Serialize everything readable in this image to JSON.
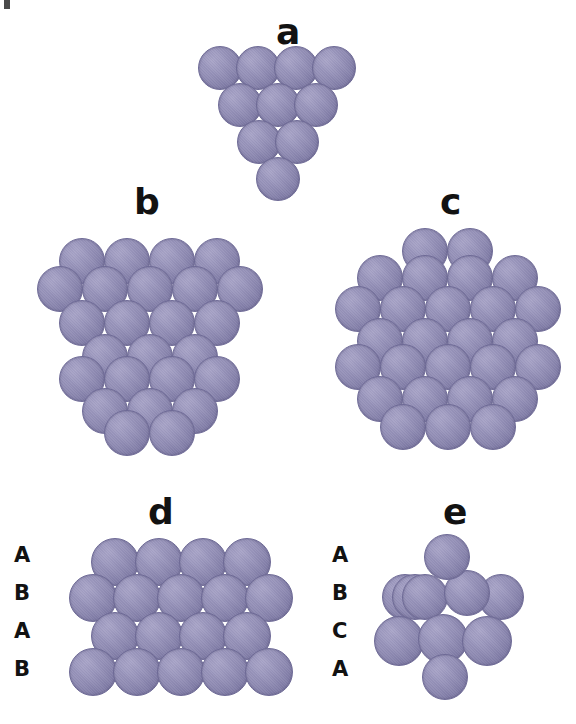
{
  "figure": {
    "background_color": "#ffffff",
    "atom_color": "#8d89b1",
    "atom_highlight_color": "#a9a5c8",
    "atom_shadow_color": "#6b6791",
    "label_color": "#121212"
  },
  "panels": [
    {
      "id": "a",
      "label": "a",
      "label_x": 276,
      "label_y": 14,
      "description": "tetrahedral cluster, 10 atoms",
      "atom_diameter": 44,
      "origin_x": 198,
      "origin_y": 46,
      "atoms": [
        {
          "x": 0,
          "y": 0,
          "d": 44,
          "z": 1
        },
        {
          "x": 38,
          "y": 0,
          "d": 44,
          "z": 1
        },
        {
          "x": 76,
          "y": 0,
          "d": 44,
          "z": 1
        },
        {
          "x": 114,
          "y": 0,
          "d": 44,
          "z": 1
        },
        {
          "x": 20,
          "y": 37,
          "d": 44,
          "z": 2
        },
        {
          "x": 58,
          "y": 37,
          "d": 44,
          "z": 2
        },
        {
          "x": 96,
          "y": 37,
          "d": 44,
          "z": 2
        },
        {
          "x": 39,
          "y": 74,
          "d": 44,
          "z": 3
        },
        {
          "x": 77,
          "y": 74,
          "d": 44,
          "z": 3
        },
        {
          "x": 58,
          "y": 111,
          "d": 44,
          "z": 4
        }
      ]
    },
    {
      "id": "b",
      "label": "b",
      "label_x": 134,
      "label_y": 184,
      "description": "larger tetrahedral cluster",
      "atom_diameter": 46,
      "origin_x": 34,
      "origin_y": 238,
      "atoms": [
        {
          "x": 25,
          "y": 0,
          "d": 46,
          "z": 1
        },
        {
          "x": 70,
          "y": 0,
          "d": 46,
          "z": 1
        },
        {
          "x": 115,
          "y": 0,
          "d": 46,
          "z": 1
        },
        {
          "x": 160,
          "y": 0,
          "d": 46,
          "z": 1
        },
        {
          "x": 3,
          "y": 28,
          "d": 46,
          "z": 2
        },
        {
          "x": 48,
          "y": 28,
          "d": 46,
          "z": 2
        },
        {
          "x": 93,
          "y": 28,
          "d": 46,
          "z": 2
        },
        {
          "x": 138,
          "y": 28,
          "d": 46,
          "z": 2
        },
        {
          "x": 183,
          "y": 28,
          "d": 46,
          "z": 2
        },
        {
          "x": 25,
          "y": 62,
          "d": 46,
          "z": 3
        },
        {
          "x": 70,
          "y": 62,
          "d": 46,
          "z": 3
        },
        {
          "x": 115,
          "y": 62,
          "d": 46,
          "z": 3
        },
        {
          "x": 160,
          "y": 62,
          "d": 46,
          "z": 3
        },
        {
          "x": 48,
          "y": 96,
          "d": 46,
          "z": 4
        },
        {
          "x": 93,
          "y": 96,
          "d": 46,
          "z": 4
        },
        {
          "x": 138,
          "y": 96,
          "d": 46,
          "z": 4
        },
        {
          "x": 25,
          "y": 118,
          "d": 46,
          "z": 5
        },
        {
          "x": 70,
          "y": 118,
          "d": 46,
          "z": 5
        },
        {
          "x": 115,
          "y": 118,
          "d": 46,
          "z": 5
        },
        {
          "x": 160,
          "y": 118,
          "d": 46,
          "z": 5
        },
        {
          "x": 48,
          "y": 150,
          "d": 46,
          "z": 6
        },
        {
          "x": 93,
          "y": 150,
          "d": 46,
          "z": 6
        },
        {
          "x": 138,
          "y": 150,
          "d": 46,
          "z": 6
        },
        {
          "x": 70,
          "y": 172,
          "d": 46,
          "z": 7
        },
        {
          "x": 115,
          "y": 172,
          "d": 46,
          "z": 7
        }
      ]
    },
    {
      "id": "c",
      "label": "c",
      "label_x": 440,
      "label_y": 184,
      "description": "hexagonal cuboctahedral cluster",
      "atom_diameter": 46,
      "origin_x": 330,
      "origin_y": 228,
      "atoms": [
        {
          "x": 72,
          "y": 0,
          "d": 46,
          "z": 1
        },
        {
          "x": 117,
          "y": 0,
          "d": 46,
          "z": 1
        },
        {
          "x": 27,
          "y": 27,
          "d": 46,
          "z": 2
        },
        {
          "x": 72,
          "y": 27,
          "d": 46,
          "z": 2
        },
        {
          "x": 117,
          "y": 27,
          "d": 46,
          "z": 2
        },
        {
          "x": 162,
          "y": 27,
          "d": 46,
          "z": 2
        },
        {
          "x": 5,
          "y": 58,
          "d": 46,
          "z": 3
        },
        {
          "x": 50,
          "y": 58,
          "d": 46,
          "z": 3
        },
        {
          "x": 95,
          "y": 58,
          "d": 46,
          "z": 3
        },
        {
          "x": 140,
          "y": 58,
          "d": 46,
          "z": 3
        },
        {
          "x": 185,
          "y": 58,
          "d": 46,
          "z": 3
        },
        {
          "x": 27,
          "y": 90,
          "d": 46,
          "z": 4
        },
        {
          "x": 72,
          "y": 90,
          "d": 46,
          "z": 4
        },
        {
          "x": 117,
          "y": 90,
          "d": 46,
          "z": 4
        },
        {
          "x": 162,
          "y": 90,
          "d": 46,
          "z": 4
        },
        {
          "x": 5,
          "y": 116,
          "d": 46,
          "z": 5
        },
        {
          "x": 50,
          "y": 116,
          "d": 46,
          "z": 5
        },
        {
          "x": 95,
          "y": 116,
          "d": 46,
          "z": 5
        },
        {
          "x": 140,
          "y": 116,
          "d": 46,
          "z": 5
        },
        {
          "x": 185,
          "y": 116,
          "d": 46,
          "z": 5
        },
        {
          "x": 27,
          "y": 148,
          "d": 46,
          "z": 6
        },
        {
          "x": 72,
          "y": 148,
          "d": 46,
          "z": 6
        },
        {
          "x": 117,
          "y": 148,
          "d": 46,
          "z": 6
        },
        {
          "x": 162,
          "y": 148,
          "d": 46,
          "z": 6
        },
        {
          "x": 50,
          "y": 176,
          "d": 46,
          "z": 7
        },
        {
          "x": 95,
          "y": 176,
          "d": 46,
          "z": 7
        },
        {
          "x": 140,
          "y": 176,
          "d": 46,
          "z": 7
        }
      ]
    },
    {
      "id": "d",
      "label": "d",
      "label_x": 148,
      "label_y": 494,
      "description": "hcp ABAB layer stacking, side view",
      "atom_diameter": 48,
      "origin_x": 66,
      "origin_y": 538,
      "stacking_labels": [
        {
          "text": "A",
          "x": 14,
          "y": 545
        },
        {
          "text": "B",
          "x": 14,
          "y": 583
        },
        {
          "text": "A",
          "x": 14,
          "y": 621
        },
        {
          "text": "B",
          "x": 14,
          "y": 659
        }
      ],
      "atoms": [
        {
          "x": 25,
          "y": 0,
          "d": 48,
          "z": 1
        },
        {
          "x": 69,
          "y": 0,
          "d": 48,
          "z": 1
        },
        {
          "x": 113,
          "y": 0,
          "d": 48,
          "z": 1
        },
        {
          "x": 157,
          "y": 0,
          "d": 48,
          "z": 1
        },
        {
          "x": 3,
          "y": 36,
          "d": 48,
          "z": 2
        },
        {
          "x": 47,
          "y": 36,
          "d": 48,
          "z": 2
        },
        {
          "x": 91,
          "y": 36,
          "d": 48,
          "z": 2
        },
        {
          "x": 135,
          "y": 36,
          "d": 48,
          "z": 2
        },
        {
          "x": 179,
          "y": 36,
          "d": 48,
          "z": 2
        },
        {
          "x": 25,
          "y": 74,
          "d": 48,
          "z": 3
        },
        {
          "x": 69,
          "y": 74,
          "d": 48,
          "z": 3
        },
        {
          "x": 113,
          "y": 74,
          "d": 48,
          "z": 3
        },
        {
          "x": 157,
          "y": 74,
          "d": 48,
          "z": 3
        },
        {
          "x": 3,
          "y": 110,
          "d": 48,
          "z": 4
        },
        {
          "x": 47,
          "y": 110,
          "d": 48,
          "z": 4
        },
        {
          "x": 91,
          "y": 110,
          "d": 48,
          "z": 4
        },
        {
          "x": 135,
          "y": 110,
          "d": 48,
          "z": 4
        },
        {
          "x": 179,
          "y": 110,
          "d": 48,
          "z": 4
        }
      ]
    },
    {
      "id": "e",
      "label": "e",
      "label_x": 443,
      "label_y": 494,
      "description": "fcc ABCA layer stacking, cluster view",
      "atom_diameter": 48,
      "origin_x": 366,
      "origin_y": 534,
      "stacking_labels": [
        {
          "text": "A",
          "x": 332,
          "y": 545
        },
        {
          "text": "B",
          "x": 332,
          "y": 583
        },
        {
          "text": "C",
          "x": 332,
          "y": 621
        },
        {
          "text": "A",
          "x": 332,
          "y": 659
        }
      ],
      "atoms": [
        {
          "x": 58,
          "y": 0,
          "d": 46,
          "z": 4
        },
        {
          "x": 16,
          "y": 40,
          "d": 46,
          "z": 1
        },
        {
          "x": 26,
          "y": 40,
          "d": 46,
          "z": 2
        },
        {
          "x": 36,
          "y": 40,
          "d": 46,
          "z": 3
        },
        {
          "x": 78,
          "y": 36,
          "d": 46,
          "z": 3
        },
        {
          "x": 112,
          "y": 40,
          "d": 46,
          "z": 2
        },
        {
          "x": 8,
          "y": 82,
          "d": 50,
          "z": 5
        },
        {
          "x": 52,
          "y": 80,
          "d": 50,
          "z": 5
        },
        {
          "x": 96,
          "y": 82,
          "d": 50,
          "z": 5
        },
        {
          "x": 56,
          "y": 120,
          "d": 46,
          "z": 6
        }
      ]
    }
  ],
  "artifacts": [
    {
      "name": "scan-mark",
      "x": 4,
      "y": 0,
      "w": 6,
      "h": 9
    }
  ]
}
